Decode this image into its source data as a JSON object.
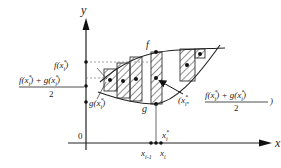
{
  "diagram": {
    "axes": {
      "x_label": "x",
      "y_label": "y",
      "origin_label": "0"
    },
    "curves": {
      "upper_label": "f",
      "lower_label": "g"
    },
    "left_labels": {
      "f_value": "f(x",
      "f_value_sup": "*",
      "f_value_sub": "i",
      "f_value_close": ")",
      "mid_numerator_f": "f(x",
      "mid_numerator_plus": ") + g(x",
      "mid_numerator_close": ")",
      "mid_denominator": "2",
      "g_value": "g(x",
      "g_value_close": ")",
      "star": "*",
      "sub_i": "i"
    },
    "point_label": {
      "open": "(x",
      "comma": ",",
      "numerator_f": "f(x",
      "numerator_plus": ") + g(x",
      "numerator_close": ")",
      "denominator": "2",
      "close": ")",
      "star": "*",
      "sub_i": "i"
    },
    "x_ticks": {
      "x_prev": "x",
      "x_prev_sub": "i-1",
      "x_curr": "x",
      "x_curr_sub": "i",
      "x_star": "x",
      "x_star_sup": "*",
      "x_star_sub": "i"
    },
    "colors": {
      "line": "#222222",
      "hatch": "#333333",
      "background": "#ffffff"
    }
  }
}
